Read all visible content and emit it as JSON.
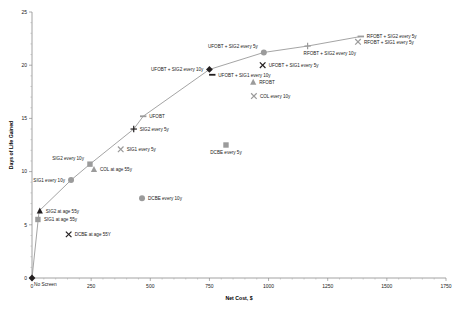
{
  "chart_data": {
    "type": "scatter",
    "title": "",
    "xlabel": "Net Cost, $",
    "ylabel": "Days of Life Gained",
    "xlim": [
      0,
      1750
    ],
    "ylim": [
      0,
      25
    ],
    "xticks": [
      "0",
      "250",
      "500",
      "750",
      "1000",
      "1250",
      "1500",
      "1750"
    ],
    "yticks": [
      "0",
      "5",
      "10",
      "15",
      "20",
      "25"
    ],
    "grid": false,
    "legend": "none",
    "origin_annotation": "No Screen",
    "frontier": {
      "name": "Efficiency frontier",
      "points": [
        {
          "x": 0,
          "y": 0
        },
        {
          "x": 30,
          "y": 6.3
        },
        {
          "x": 165,
          "y": 9.2
        },
        {
          "x": 245,
          "y": 10.7
        },
        {
          "x": 430,
          "y": 14.0
        },
        {
          "x": 470,
          "y": 15.2
        },
        {
          "x": 750,
          "y": 19.6
        },
        {
          "x": 980,
          "y": 21.2
        },
        {
          "x": 1165,
          "y": 21.8
        },
        {
          "x": 1390,
          "y": 22.7
        }
      ]
    },
    "points": [
      {
        "label": "No Screen",
        "x": 0,
        "y": 0,
        "marker": "diamond-black",
        "on_frontier": true,
        "label_pos": "below-right"
      },
      {
        "label": "SIG1 at age 55y",
        "x": 25,
        "y": 5.5,
        "marker": "square-gray",
        "on_frontier": false,
        "label_pos": "right"
      },
      {
        "label": "SIG2 at age 55y",
        "x": 33,
        "y": 6.3,
        "marker": "triangle-dark",
        "on_frontier": true,
        "label_pos": "right"
      },
      {
        "label": "DCBE at age 55Y",
        "x": 155,
        "y": 4.1,
        "marker": "x-dark",
        "on_frontier": false,
        "label_pos": "right"
      },
      {
        "label": "SIG1 every 10y",
        "x": 165,
        "y": 9.2,
        "marker": "circle-gray",
        "on_frontier": true,
        "label_pos": "left"
      },
      {
        "label": "SIG2 every 10y",
        "x": 245,
        "y": 10.7,
        "marker": "square-gray",
        "on_frontier": true,
        "label_pos": "upper-left"
      },
      {
        "label": "COL at age 55y",
        "x": 262,
        "y": 10.2,
        "marker": "triangle-gray",
        "on_frontier": false,
        "label_pos": "right"
      },
      {
        "label": "DCBE every 10y",
        "x": 465,
        "y": 7.5,
        "marker": "circle-gray",
        "on_frontier": false,
        "label_pos": "right"
      },
      {
        "label": "SIG1 every 5y",
        "x": 375,
        "y": 12.1,
        "marker": "x-gray",
        "on_frontier": false,
        "label_pos": "right"
      },
      {
        "label": "SIG2 every 5y",
        "x": 430,
        "y": 14.0,
        "marker": "plus-dark",
        "on_frontier": true,
        "label_pos": "right"
      },
      {
        "label": "UFOBT",
        "x": 470,
        "y": 15.2,
        "marker": "dash-gray",
        "on_frontier": true,
        "label_pos": "right"
      },
      {
        "label": "DCBE every 5y",
        "x": 820,
        "y": 12.5,
        "marker": "square-gray",
        "on_frontier": false,
        "label_pos": "below"
      },
      {
        "label": "UFOBT + SIG2 every 10y",
        "x": 750,
        "y": 19.6,
        "marker": "diamond-black",
        "on_frontier": true,
        "label_pos": "left"
      },
      {
        "label": "UFOBT + SIG1 every 10y",
        "x": 762,
        "y": 19.1,
        "marker": "dash-dark",
        "on_frontier": false,
        "label_pos": "right"
      },
      {
        "label": "RFOBT",
        "x": 935,
        "y": 18.4,
        "marker": "triangle-gray",
        "on_frontier": false,
        "label_pos": "right"
      },
      {
        "label": "COL every 10y",
        "x": 938,
        "y": 17.1,
        "marker": "x-gray",
        "on_frontier": false,
        "label_pos": "right"
      },
      {
        "label": "UFOBT + SIG1 every 5y",
        "x": 975,
        "y": 20.0,
        "marker": "x-dark",
        "on_frontier": false,
        "label_pos": "right"
      },
      {
        "label": "UFOBT + SIG2 every 5y",
        "x": 980,
        "y": 21.2,
        "marker": "circle-gray",
        "on_frontier": true,
        "label_pos": "upper-left"
      },
      {
        "label": "RFOBT + SIG2 every 10y",
        "x": 1165,
        "y": 21.8,
        "marker": "plus-gray",
        "on_frontier": true,
        "label_pos": "below-right"
      },
      {
        "label": "RFOBT + SIG2 every 5y",
        "x": 1390,
        "y": 22.7,
        "marker": "dash-gray",
        "on_frontier": true,
        "label_pos": "right"
      },
      {
        "label": "RFOBT + SIG1 every 5y",
        "x": 1378,
        "y": 22.2,
        "marker": "x-gray",
        "on_frontier": false,
        "label_pos": "right"
      }
    ]
  },
  "colors": {
    "axis": "#8c8c8c",
    "frontier_line": "#9a9a9a",
    "marker_dark": "#231f20",
    "marker_gray": "#9b9b9b",
    "text": "#1a1a1a"
  }
}
